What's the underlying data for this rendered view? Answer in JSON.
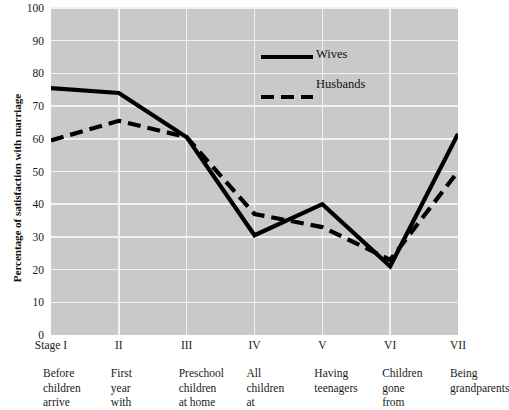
{
  "chart_data": {
    "type": "line",
    "title": "",
    "xlabel": "",
    "ylabel": "Percentage of satisfaction with marriage",
    "ylim": [
      0,
      100
    ],
    "ytick_labels": [
      "100",
      "90",
      "80",
      "70",
      "60",
      "50",
      "40",
      "30",
      "20",
      "10",
      "0"
    ],
    "ytick_values": [
      100,
      90,
      80,
      70,
      60,
      50,
      40,
      30,
      20,
      10,
      0
    ],
    "categories": [
      "Stage I",
      "II",
      "III",
      "IV",
      "V",
      "VI",
      "VII"
    ],
    "category_captions": [
      "Before\nchildren\narrive",
      "First\nyear\nwith",
      "Preschool\nchildren\nat home",
      "All\nchildren\nat",
      "Having\nteenagers",
      "Children\ngone\nfrom",
      "Being\ngrandparents"
    ],
    "series": [
      {
        "name": "Wives",
        "style": "solid",
        "color": "#000000",
        "values": [
          75.5,
          74,
          60.5,
          30.5,
          40,
          21,
          61.5
        ]
      },
      {
        "name": "Husbands",
        "style": "dashed",
        "color": "#000000",
        "values": [
          59.5,
          65.5,
          60.5,
          37,
          33,
          23,
          50
        ]
      }
    ],
    "grid": true,
    "grid_color": "#f2f2f2",
    "plot_background": "#c9c9c9",
    "legend_position": "upper-center"
  },
  "legend": {
    "items": [
      {
        "label": "Wives",
        "style": "solid"
      },
      {
        "label": "Husbands",
        "style": "dashed"
      }
    ]
  }
}
